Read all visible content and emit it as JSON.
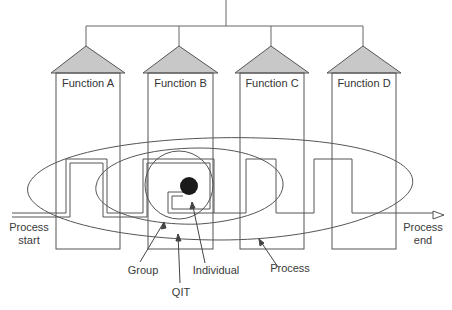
{
  "diagram": {
    "functions": [
      {
        "label": "Function A"
      },
      {
        "label": "Function B"
      },
      {
        "label": "Function C"
      },
      {
        "label": "Function D"
      }
    ],
    "flow": {
      "start_label_line1": "Process",
      "start_label_line2": "start",
      "end_label_line1": "Process",
      "end_label_line2": "end"
    },
    "scopes": [
      {
        "label": "Individual"
      },
      {
        "label": "Group"
      },
      {
        "label": "QIT"
      },
      {
        "label": "Process"
      }
    ],
    "colors": {
      "line": "#555555",
      "roof_fill": "#c8c8c8",
      "individual_dot": "#1a1a1a"
    }
  }
}
